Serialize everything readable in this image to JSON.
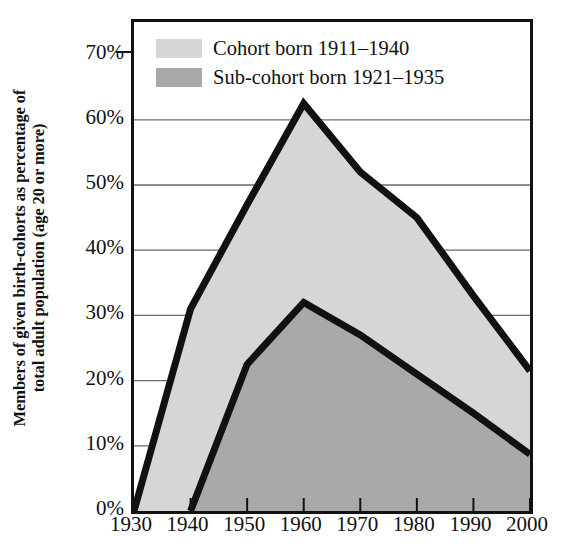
{
  "chart_data": {
    "type": "area",
    "title": "",
    "subtitle": "",
    "xlabel": "",
    "ylabel": "Members of given birth-cohorts as percentage of total adult population (age 20 or more)",
    "ylabel_lines": [
      "Members of given birth-cohorts as percentage of",
      "total adult population (age 20 or more)"
    ],
    "x": [
      1930,
      1940,
      1950,
      1960,
      1970,
      1980,
      1990,
      2000
    ],
    "xlim": [
      1930,
      2000
    ],
    "ylim": [
      0,
      75
    ],
    "xticks": [
      "1930",
      "1940",
      "1950",
      "1960",
      "1970",
      "1980",
      "1990",
      "2000"
    ],
    "yticks": [
      "0%",
      "10%",
      "20%",
      "30%",
      "40%",
      "50%",
      "60%",
      "70%"
    ],
    "ytick_values": [
      0,
      10,
      20,
      30,
      40,
      50,
      60,
      70
    ],
    "grid": "horizontal",
    "legend_position": "top-left",
    "series": [
      {
        "name": "Cohort born 1911–1940",
        "fill": "#d6d6d6",
        "line": "#111111",
        "values": [
          0,
          31,
          47,
          62.5,
          52,
          45,
          33,
          21.5
        ]
      },
      {
        "name": "Sub-cohort born 1921–1935",
        "fill": "#a9a9a9",
        "line": "#111111",
        "values": [
          0,
          0,
          22.5,
          32,
          27,
          21,
          15,
          8.7
        ]
      }
    ]
  },
  "axes": {
    "y_title_lines": [
      "Members of given birth-cohorts as percentage of",
      "total adult population (age 20 or more)"
    ],
    "y_ticks": [
      "0%",
      "10%",
      "20%",
      "30%",
      "40%",
      "50%",
      "60%",
      "70%"
    ],
    "x_ticks": [
      "1930",
      "1940",
      "1950",
      "1960",
      "1970",
      "1980",
      "1990",
      "2000"
    ]
  },
  "legend": {
    "items": [
      {
        "label": "Cohort born 1911–1940",
        "color": "#d6d6d6"
      },
      {
        "label": "Sub-cohort born 1921–1935",
        "color": "#a9a9a9"
      }
    ]
  },
  "colors": {
    "cohort_fill": "#d6d6d6",
    "subcohort_fill": "#a9a9a9",
    "line": "#111111",
    "grid": "#6a6a6a",
    "background": "#ffffff"
  }
}
